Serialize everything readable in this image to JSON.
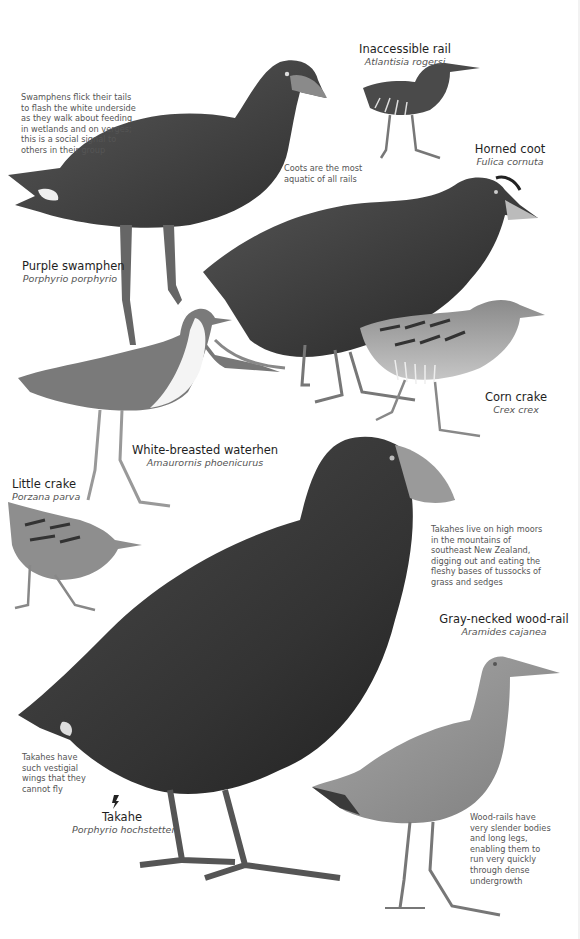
{
  "species": [
    {
      "id": "inaccessible-rail",
      "common": "Inaccessible rail",
      "scientific": "Atlantisia rogersi"
    },
    {
      "id": "horned-coot",
      "common": "Horned coot",
      "scientific": "Fulica cornuta"
    },
    {
      "id": "purple-swamphen",
      "common": "Purple swamphen",
      "scientific": "Porphyrio porphyrio"
    },
    {
      "id": "corn-crake",
      "common": "Corn crake",
      "scientific": "Crex crex"
    },
    {
      "id": "white-breasted-waterhen",
      "common": "White-breasted waterhen",
      "scientific": "Amaurornis phoenicurus"
    },
    {
      "id": "little-crake",
      "common": "Little crake",
      "scientific": "Porzana parva"
    },
    {
      "id": "gray-necked-wood-rail",
      "common": "Gray-necked wood-rail",
      "scientific": "Aramides cajanea"
    },
    {
      "id": "takahe",
      "common": "Takahe",
      "scientific": "Porphyrio hochstetteri"
    }
  ],
  "notes": {
    "swamphen": "Swamphens flick their tails to flash the white underside as they walk about feeding in wetlands and on verges; this is a social signal to others in their group",
    "coot": "Coots are the most aquatic of all rails",
    "takahe_habitat": "Takahes live on high moors in the mountains of southeast New Zealand, digging out and eating the fleshy bases of tussocks of grass and sedges",
    "takahe_wings": "Takahes have such vestigial wings that they cannot fly",
    "wood_rail": "Wood-rails have very slender bodies and long legs, enabling them to run very quickly through dense undergrowth"
  },
  "icons": {
    "endangered": "endangered-status-icon"
  }
}
